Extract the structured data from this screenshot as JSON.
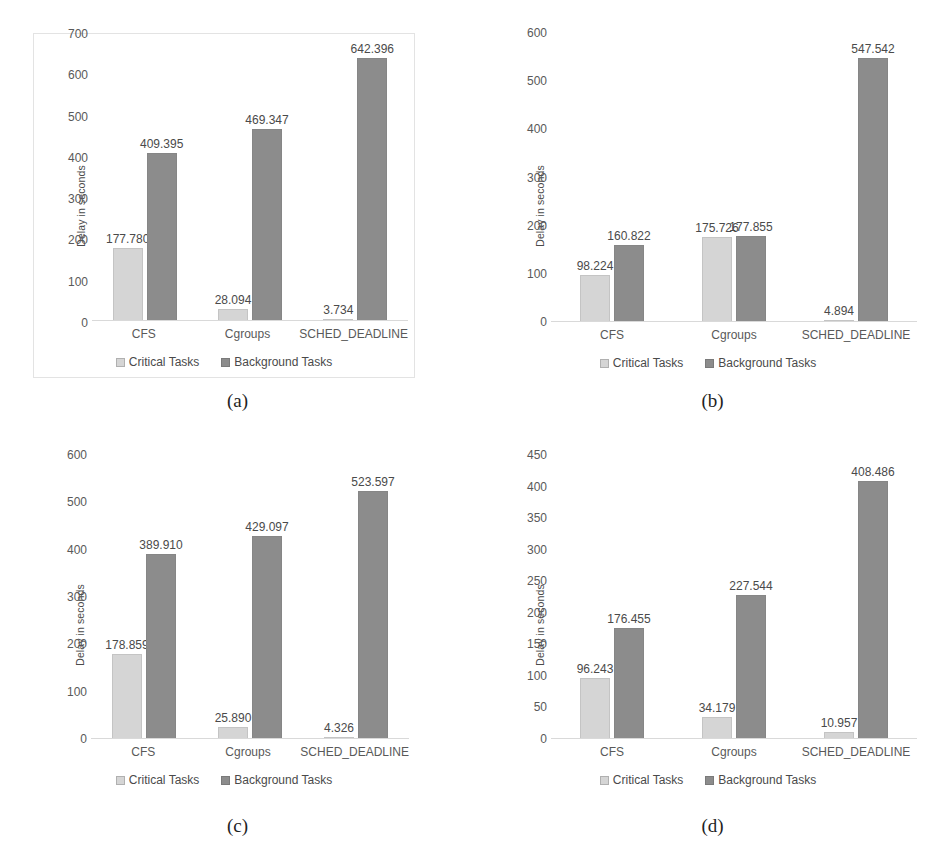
{
  "figure": {
    "axis_title": "Delay in seconds",
    "categories": [
      "CFS",
      "Cgroups",
      "SCHED_DEADLINE"
    ],
    "legend": [
      {
        "label": "Critical Tasks",
        "color": "#d5d5d5",
        "icon": "square-swatch-icon"
      },
      {
        "label": "Background Tasks",
        "color": "#8c8c8c",
        "icon": "square-swatch-icon"
      }
    ],
    "captions": [
      "(a)",
      "(b)",
      "(c)",
      "(d)"
    ]
  },
  "chart_data": [
    {
      "type": "bar",
      "panel": "(a)",
      "title": "",
      "xlabel": "",
      "ylabel": "Delay in seconds",
      "categories": [
        "CFS",
        "Cgroups",
        "SCHED_DEADLINE"
      ],
      "series": [
        {
          "name": "Critical Tasks",
          "values": [
            177.78,
            28.094,
            3.734
          ],
          "labels": [
            "177.780",
            "28.094",
            "3.734"
          ],
          "color": "#d5d5d5"
        },
        {
          "name": "Background Tasks",
          "values": [
            409.395,
            469.347,
            642.396
          ],
          "labels": [
            "409.395",
            "469.347",
            "642.396"
          ],
          "color": "#8c8c8c"
        }
      ],
      "ylim": [
        0,
        700
      ],
      "yticks": [
        0,
        100,
        200,
        300,
        400,
        500,
        600,
        700
      ],
      "ytick_labels": [
        "0",
        "100",
        "200",
        "300",
        "400",
        "500",
        "600",
        "700"
      ],
      "grid": false,
      "legend_position": "bottom",
      "bordered": true
    },
    {
      "type": "bar",
      "panel": "(b)",
      "title": "",
      "xlabel": "",
      "ylabel": "Delay in seconds",
      "categories": [
        "CFS",
        "Cgroups",
        "SCHED_DEADLINE"
      ],
      "series": [
        {
          "name": "Critical Tasks",
          "values": [
            98.224,
            175.726,
            4.894
          ],
          "labels": [
            "98.224",
            "175.726",
            "4.894"
          ],
          "color": "#d5d5d5"
        },
        {
          "name": "Background Tasks",
          "values": [
            160.822,
            177.855,
            547.542
          ],
          "labels": [
            "160.822",
            "177.855",
            "547.542"
          ],
          "color": "#8c8c8c"
        }
      ],
      "ylim": [
        0,
        600
      ],
      "yticks": [
        0,
        100,
        200,
        300,
        400,
        500,
        600
      ],
      "ytick_labels": [
        "0",
        "100",
        "200",
        "300",
        "400",
        "500",
        "600"
      ],
      "grid": false,
      "legend_position": "bottom",
      "bordered": false
    },
    {
      "type": "bar",
      "panel": "(c)",
      "title": "",
      "xlabel": "",
      "ylabel": "Delay in seconds",
      "categories": [
        "CFS",
        "Cgroups",
        "SCHED_DEADLINE"
      ],
      "series": [
        {
          "name": "Critical Tasks",
          "values": [
            178.859,
            25.89,
            4.326
          ],
          "labels": [
            "178.859",
            "25.890",
            "4.326"
          ],
          "color": "#d5d5d5"
        },
        {
          "name": "Background Tasks",
          "values": [
            389.91,
            429.097,
            523.597
          ],
          "labels": [
            "389.910",
            "429.097",
            "523.597"
          ],
          "color": "#8c8c8c"
        }
      ],
      "ylim": [
        0,
        600
      ],
      "yticks": [
        0,
        100,
        200,
        300,
        400,
        500,
        600
      ],
      "ytick_labels": [
        "0",
        "100",
        "200",
        "300",
        "400",
        "500",
        "600"
      ],
      "grid": false,
      "legend_position": "bottom",
      "bordered": false
    },
    {
      "type": "bar",
      "panel": "(d)",
      "title": "",
      "xlabel": "",
      "ylabel": "Delay in seconds",
      "categories": [
        "CFS",
        "Cgroups",
        "SCHED_DEADLINE"
      ],
      "series": [
        {
          "name": "Critical Tasks",
          "values": [
            96.243,
            34.179,
            10.957
          ],
          "labels": [
            "96.243",
            "34.179",
            "10.957"
          ],
          "color": "#d5d5d5"
        },
        {
          "name": "Background Tasks",
          "values": [
            176.455,
            227.544,
            408.486
          ],
          "labels": [
            "176.455",
            "227.544",
            "408.486"
          ],
          "color": "#8c8c8c"
        }
      ],
      "ylim": [
        0,
        450
      ],
      "yticks": [
        0,
        50,
        100,
        150,
        200,
        250,
        300,
        350,
        400,
        450
      ],
      "ytick_labels": [
        "0",
        "50",
        "100",
        "150",
        "200",
        "250",
        "300",
        "350",
        "400",
        "450"
      ],
      "grid": false,
      "legend_position": "bottom",
      "bordered": false
    }
  ]
}
